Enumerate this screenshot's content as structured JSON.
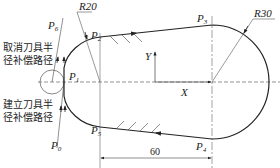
{
  "diagram": {
    "points": [
      {
        "id": "P0",
        "name": "P",
        "sub": "0"
      },
      {
        "id": "P1",
        "name": "P",
        "sub": "1"
      },
      {
        "id": "P2",
        "name": "P",
        "sub": "2"
      },
      {
        "id": "P3",
        "name": "P",
        "sub": "3"
      },
      {
        "id": "P4",
        "name": "P",
        "sub": "4"
      },
      {
        "id": "P5",
        "name": "P",
        "sub": "5"
      },
      {
        "id": "P6",
        "name": "P",
        "sub": "6"
      }
    ],
    "radius_labels": {
      "left": "R20",
      "right": "R30"
    },
    "axis_labels": {
      "x": "X",
      "y": "Y"
    },
    "dimension": "60",
    "annotations": {
      "cancel_line1": "取消刀具半",
      "cancel_line2": "径补偿路径",
      "setup_line1": "建立刀具半",
      "setup_line2": "径补偿路径"
    },
    "colors": {
      "line": "#222222",
      "thin": "#555555"
    }
  }
}
